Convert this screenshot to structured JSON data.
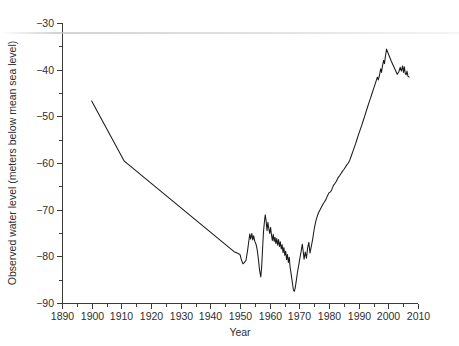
{
  "chart_data": {
    "type": "line",
    "title": "",
    "subtitle": "",
    "xlabel": "Year",
    "ylabel": "Observed water level (meters below mean sea level)",
    "xlim": [
      1890,
      2010
    ],
    "ylim": [
      -90,
      -30
    ],
    "grid": false,
    "legend": null,
    "x_ticks": [
      1890,
      1900,
      1910,
      1920,
      1930,
      1940,
      1950,
      1960,
      1970,
      1980,
      1990,
      2000,
      2010
    ],
    "x_tick_labels": [
      "1890",
      "1900",
      "1910",
      "1920",
      "1930",
      "1940",
      "1950",
      "1960",
      "1970",
      "1980",
      "1990",
      "2000",
      "2010"
    ],
    "x_minor_ticks": [
      1895,
      1905,
      1915,
      1925,
      1935,
      1945,
      1955,
      1965,
      1975,
      1985,
      1995,
      2005
    ],
    "y_ticks": [
      -30,
      -40,
      -50,
      -60,
      -70,
      -80,
      -90
    ],
    "y_tick_labels": [
      "−30",
      "−40",
      "−50",
      "−60",
      "−70",
      "−80",
      "−90"
    ],
    "y_minor_ticks": [
      -35,
      -45,
      -55,
      -65,
      -75,
      -85
    ],
    "line_color": "#1a1a1a",
    "series": [
      {
        "name": "Observed water level",
        "x": [
          1900,
          1911,
          1948,
          1949,
          1950,
          1950.5,
          1951,
          1951.5,
          1952,
          1952.5,
          1953,
          1953.3,
          1953.6,
          1954,
          1954.3,
          1954.6,
          1955,
          1955.4,
          1955.8,
          1956.2,
          1956.6,
          1957,
          1957.3,
          1957.6,
          1957.9,
          1958.2,
          1958.5,
          1958.8,
          1959.1,
          1959.4,
          1959.7,
          1960,
          1960.3,
          1960.6,
          1960.9,
          1961.2,
          1961.5,
          1961.8,
          1962.1,
          1962.4,
          1962.7,
          1963,
          1963.3,
          1963.6,
          1963.9,
          1964.2,
          1964.5,
          1964.8,
          1965.1,
          1965.4,
          1965.7,
          1966,
          1966.3,
          1966.6,
          1966.9,
          1967.2,
          1967.5,
          1967.8,
          1968,
          1968.3,
          1968.6,
          1969,
          1969.4,
          1969.8,
          1970.2,
          1970.6,
          1971,
          1971.3,
          1971.6,
          1972,
          1972.4,
          1972.8,
          1973.2,
          1973.6,
          1974,
          1974.5,
          1975,
          1975.5,
          1976,
          1976.5,
          1977,
          1977.5,
          1978,
          1978.5,
          1979,
          1979.5,
          1980,
          1980.5,
          1981,
          1981.5,
          1982,
          1982.5,
          1983,
          1983.5,
          1984,
          1984.5,
          1985,
          1985.5,
          1986,
          1986.5,
          1987,
          1987.5,
          1988,
          1988.5,
          1989,
          1989.5,
          1990,
          1990.5,
          1991,
          1991.5,
          1992,
          1992.5,
          1993,
          1993.5,
          1994,
          1994.5,
          1995,
          1995.5,
          1996,
          1996.3,
          1996.6,
          1997,
          1997.4,
          1997.7,
          1998,
          1998.4,
          1998.7,
          1999,
          1999.4,
          2000,
          2000.5,
          2001,
          2001.5,
          2002,
          2002.5,
          2003,
          2003.5,
          2004,
          2004.4,
          2004.8,
          2005.1,
          2005.4,
          2005.7,
          2006,
          2006.3,
          2006.6,
          2007
        ],
        "y": [
          -46.7,
          -59.6,
          -79.0,
          -79.3,
          -79.6,
          -80.8,
          -81.6,
          -81.3,
          -80.9,
          -79.0,
          -76.6,
          -75.2,
          -76.3,
          -75.1,
          -76.5,
          -75.6,
          -76.8,
          -77.4,
          -78.6,
          -80.6,
          -83.0,
          -84.4,
          -82.2,
          -78.5,
          -74.9,
          -72.8,
          -71.1,
          -72.4,
          -74.5,
          -72.7,
          -74.0,
          -75.1,
          -73.8,
          -75.4,
          -76.6,
          -75.3,
          -76.8,
          -75.9,
          -77.3,
          -76.2,
          -77.6,
          -76.4,
          -77.9,
          -76.9,
          -78.4,
          -77.5,
          -79.2,
          -78.1,
          -79.8,
          -78.9,
          -80.7,
          -79.6,
          -81.3,
          -80.2,
          -82.4,
          -83.6,
          -85.0,
          -86.3,
          -87.2,
          -87.5,
          -86.8,
          -85.1,
          -83.3,
          -81.9,
          -80.3,
          -79.0,
          -77.4,
          -78.9,
          -80.6,
          -79.1,
          -80.4,
          -78.2,
          -77.0,
          -79.3,
          -78.0,
          -76.3,
          -74.2,
          -72.6,
          -71.5,
          -70.6,
          -70.0,
          -69.4,
          -68.8,
          -68.3,
          -67.8,
          -67.0,
          -66.4,
          -66.2,
          -65.6,
          -64.8,
          -64.4,
          -63.9,
          -63.2,
          -62.8,
          -62.3,
          -61.8,
          -61.4,
          -60.9,
          -60.4,
          -60.0,
          -59.4,
          -58.5,
          -57.6,
          -56.7,
          -55.8,
          -54.8,
          -53.8,
          -52.9,
          -52.0,
          -51.0,
          -50.0,
          -49.0,
          -48.0,
          -47.0,
          -46.1,
          -45.1,
          -44.1,
          -43.2,
          -42.2,
          -41.6,
          -42.2,
          -41.3,
          -39.8,
          -40.6,
          -39.3,
          -38.0,
          -38.7,
          -37.2,
          -35.6,
          -36.6,
          -37.4,
          -38.2,
          -38.9,
          -39.6,
          -40.3,
          -41.0,
          -40.5,
          -39.5,
          -40.3,
          -39.2,
          -40.6,
          -39.4,
          -40.8,
          -41.1,
          -40.3,
          -41.4,
          -41.6
        ]
      }
    ]
  }
}
